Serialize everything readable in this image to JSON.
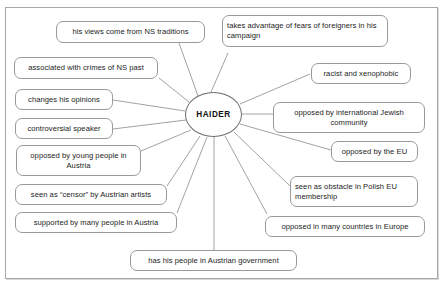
{
  "diagram": {
    "type": "mind-map",
    "center": {
      "label": "HAIDER"
    },
    "nodes": [
      {
        "id": "ns-traditions",
        "label": "his views come from NS traditions"
      },
      {
        "id": "fears-foreigners",
        "label": "takes advantage of fears of foreigners in his campaign"
      },
      {
        "id": "crimes-ns-past",
        "label": "associated with crimes of NS past"
      },
      {
        "id": "racist-xenophobic",
        "label": "racist and xenophobic"
      },
      {
        "id": "changes-opinions",
        "label": "changes his opinions"
      },
      {
        "id": "jewish-community",
        "label": "opposed by international Jewish community"
      },
      {
        "id": "controversial-speaker",
        "label": "controversial speaker"
      },
      {
        "id": "opposed-eu",
        "label": "opposed by the EU"
      },
      {
        "id": "young-people",
        "label": "opposed by young people in Austria"
      },
      {
        "id": "polish-eu",
        "label": "seen as obstacle in Polish EU membership"
      },
      {
        "id": "censor-artists",
        "label": "seen as “censor” by Austrian artists"
      },
      {
        "id": "opposed-europe",
        "label": "opposed in many countries in Europe"
      },
      {
        "id": "supported-austria",
        "label": "supported by many people in Austria"
      },
      {
        "id": "austrian-government",
        "label": "has his people in Austrian government"
      }
    ],
    "colors": {
      "node_border": "#9a9a9a",
      "center_border": "#6d6d6d",
      "edge": "#8a8a8a",
      "frame_border": "#a8a8a8",
      "background": "#ffffff",
      "text": "#1c1c1c"
    }
  }
}
